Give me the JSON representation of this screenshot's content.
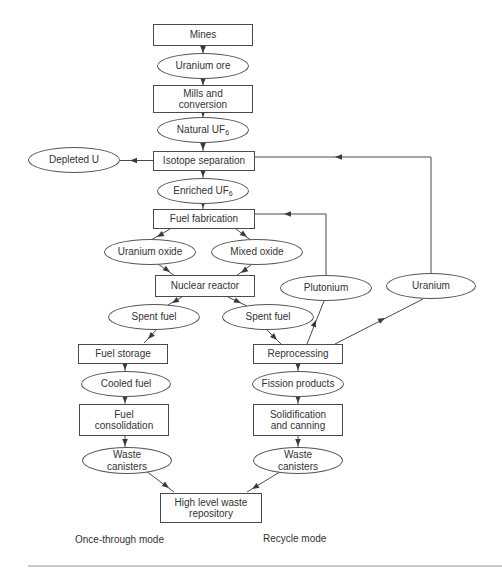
{
  "diagram": {
    "nodes": [
      {
        "id": "mines",
        "shape": "rect",
        "line1": "Mines"
      },
      {
        "id": "uranium-ore",
        "shape": "ellipse",
        "line1": "Uranium ore"
      },
      {
        "id": "mills-and-conversion",
        "shape": "rect",
        "line1": "Mills and",
        "line2": "conversion"
      },
      {
        "id": "natural-uf6",
        "shape": "ellipse",
        "line1": "Natural UF",
        "sub": "6"
      },
      {
        "id": "depleted-u",
        "shape": "ellipse",
        "line1": "Depleted U"
      },
      {
        "id": "isotope-separation",
        "shape": "rect",
        "line1": "Isotope separation"
      },
      {
        "id": "enriched-uf6",
        "shape": "ellipse",
        "line1": "Enriched UF",
        "sub": "6"
      },
      {
        "id": "fuel-fabrication",
        "shape": "rect",
        "line1": "Fuel fabrication"
      },
      {
        "id": "uranium-oxide",
        "shape": "ellipse",
        "line1": "Uranium oxide"
      },
      {
        "id": "mixed-oxide",
        "shape": "ellipse",
        "line1": "Mixed oxide"
      },
      {
        "id": "nuclear-reactor",
        "shape": "rect",
        "line1": "Nuclear reactor"
      },
      {
        "id": "plutonium",
        "shape": "ellipse",
        "line1": "Plutonium"
      },
      {
        "id": "uranium",
        "shape": "ellipse",
        "line1": "Uranium"
      },
      {
        "id": "spent-fuel-left",
        "shape": "ellipse",
        "line1": "Spent fuel"
      },
      {
        "id": "spent-fuel-right",
        "shape": "ellipse",
        "line1": "Spent fuel"
      },
      {
        "id": "fuel-storage",
        "shape": "rect",
        "line1": "Fuel storage"
      },
      {
        "id": "cooled-fuel",
        "shape": "ellipse",
        "line1": "Cooled fuel"
      },
      {
        "id": "fuel-consolidation",
        "shape": "rect",
        "line1": "Fuel",
        "line2": "consolidation"
      },
      {
        "id": "waste-canisters-left",
        "shape": "ellipse",
        "line1": "Waste",
        "line2": "canisters"
      },
      {
        "id": "reprocessing",
        "shape": "rect",
        "line1": "Reprocessing"
      },
      {
        "id": "fission-products",
        "shape": "ellipse",
        "line1": "Fission products"
      },
      {
        "id": "solidification-and-canning",
        "shape": "rect",
        "line1": "Solidification",
        "line2": "and canning"
      },
      {
        "id": "waste-canisters-right",
        "shape": "ellipse",
        "line1": "Waste",
        "line2": "canisters"
      },
      {
        "id": "high-level-waste-repository",
        "shape": "rect",
        "line1": "High level waste",
        "line2": "repository"
      }
    ],
    "captions": {
      "left": "Once-through mode",
      "right": "Recycle mode"
    },
    "colors": {
      "line": "#4a4a4a",
      "text": "#333333",
      "divider": "#c9c9c9",
      "background": "#ffffff"
    }
  }
}
